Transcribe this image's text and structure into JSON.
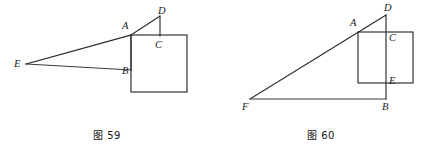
{
  "sheet": {
    "background_color": "#ffffff",
    "line_color": "#2b2b2b",
    "text_color": "#1a1a1a",
    "width": 428,
    "height": 150
  },
  "figures": [
    {
      "id": "fig-59",
      "caption": "图 59",
      "description": "Shallow triangle from apex E rising to A with short segment A-D, attached to an upright square with vertices A, B, C region",
      "vertices": [
        {
          "name": "E",
          "label": "E",
          "x": 26,
          "y": 64,
          "label_x": 14,
          "label_y": 59
        },
        {
          "name": "A",
          "label": "A",
          "x": 131,
          "y": 35,
          "label_x": 122,
          "label_y": 21
        },
        {
          "name": "D",
          "label": "D",
          "x": 160,
          "y": 16,
          "label_x": 158,
          "label_y": 8
        },
        {
          "name": "C",
          "label": "C",
          "x": 160,
          "y": 36,
          "label_x": 155,
          "label_y": 40
        },
        {
          "name": "B",
          "label": "B",
          "x": 131,
          "y": 70,
          "label_x": 122,
          "label_y": 66
        }
      ],
      "segments": [
        {
          "name": "E-to-A",
          "from": "E",
          "to": "A"
        },
        {
          "name": "A-to-D",
          "from": "A",
          "to": "D"
        },
        {
          "name": "E-to-B",
          "from": "E",
          "to": "B"
        },
        {
          "name": "D-to-C",
          "from": "D",
          "to": "C"
        },
        {
          "name": "A-B-vertical",
          "from": "A",
          "to": "B"
        }
      ],
      "rectangle": {
        "name": "square-ABCD-body",
        "left": 131,
        "top": 35,
        "right": 187,
        "bottom": 92
      }
    },
    {
      "id": "fig-60",
      "caption": "图 60",
      "description": "Large right triangle F-B-D with hypotenuse F-D passing through A, overlaid by a rectangle crossed by vertical line D-B through C and E",
      "vertices": [
        {
          "name": "F",
          "label": "F",
          "x": 250,
          "y": 99,
          "label_x": 242,
          "label_y": 102
        },
        {
          "name": "B",
          "label": "B",
          "x": 386,
          "y": 99,
          "label_x": 382,
          "label_y": 102
        },
        {
          "name": "D",
          "label": "D",
          "x": 386,
          "y": 15,
          "label_x": 384,
          "label_y": 5
        },
        {
          "name": "A",
          "label": "A",
          "x": 358,
          "y": 32,
          "label_x": 350,
          "label_y": 19
        },
        {
          "name": "C",
          "label": "C",
          "x": 386,
          "y": 32,
          "label_x": 389,
          "label_y": 33
        },
        {
          "name": "E",
          "label": "E",
          "x": 386,
          "y": 83,
          "label_x": 389,
          "label_y": 77
        }
      ],
      "segments": [
        {
          "name": "F-to-D-hypotenuse",
          "from": "F",
          "to": "D"
        },
        {
          "name": "F-to-B-base",
          "from": "F",
          "to": "B"
        },
        {
          "name": "D-to-B-vertical",
          "from": "D",
          "to": "B"
        }
      ],
      "rectangle": {
        "name": "rectangle-ACEB-overlay",
        "left": 358,
        "top": 32,
        "right": 413,
        "bottom": 83
      }
    }
  ]
}
